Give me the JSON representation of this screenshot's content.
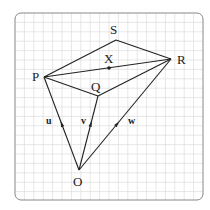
{
  "diagram": {
    "colors": {
      "line": "#222222",
      "grid": "#dcdcdc",
      "frame": "#888888",
      "background": "#ffffff"
    },
    "frame": {
      "x": 15,
      "y": 13,
      "w": 188,
      "h": 187,
      "radius": 6
    },
    "grid_spacing": 9.4,
    "points": {
      "S": {
        "label": "S",
        "x": 116,
        "y": 40,
        "lx": 110,
        "ly": 34
      },
      "R": {
        "label": "R",
        "x": 171,
        "y": 59,
        "lx": 177,
        "ly": 64
      },
      "P": {
        "label": "P",
        "x": 44,
        "y": 77,
        "lx": 32,
        "ly": 81
      },
      "Q": {
        "label": "Q",
        "x": 98,
        "y": 96,
        "lx": 91,
        "ly": 91
      },
      "X": {
        "label": "X",
        "x": 109,
        "y": 68,
        "lx": 104,
        "ly": 63
      },
      "O": {
        "label": "O",
        "x": 79,
        "y": 170,
        "lx": 73,
        "ly": 186
      }
    },
    "vectors": [
      {
        "label": "u",
        "from": "O",
        "to": "P",
        "lx": 46,
        "ly": 124
      },
      {
        "label": "v",
        "from": "O",
        "to": "Q",
        "lx": 81,
        "ly": 124
      },
      {
        "label": "w",
        "from": "O",
        "to": "R",
        "lx": 128,
        "ly": 124
      }
    ],
    "edges": [
      [
        "P",
        "S"
      ],
      [
        "S",
        "R"
      ],
      [
        "P",
        "R"
      ],
      [
        "P",
        "Q"
      ],
      [
        "Q",
        "R"
      ],
      [
        "O",
        "P"
      ],
      [
        "O",
        "Q"
      ],
      [
        "O",
        "R"
      ]
    ]
  }
}
